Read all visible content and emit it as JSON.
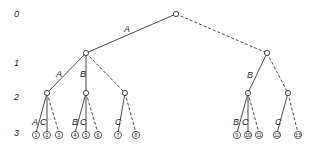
{
  "diagram": {
    "type": "decision-tree",
    "levels": [
      "0",
      "1",
      "2",
      "3"
    ],
    "nodes": {
      "root": {
        "x": 176,
        "y": 14
      },
      "l1": [
        {
          "x": 86,
          "y": 53
        },
        {
          "x": 267,
          "y": 53
        }
      ],
      "l2": [
        {
          "x": 47,
          "y": 93
        },
        {
          "x": 86,
          "y": 93
        },
        {
          "x": 125,
          "y": 93
        },
        {
          "x": 248,
          "y": 93
        },
        {
          "x": 288,
          "y": 93
        }
      ],
      "leaves": [
        {
          "label": "1",
          "x": 36,
          "y": 133
        },
        {
          "label": "2",
          "x": 47,
          "y": 133
        },
        {
          "label": "3",
          "x": 59,
          "y": 133
        },
        {
          "label": "4",
          "x": 75,
          "y": 133
        },
        {
          "label": "5",
          "x": 86,
          "y": 133
        },
        {
          "label": "6",
          "x": 98,
          "y": 133
        },
        {
          "label": "7",
          "x": 118,
          "y": 133
        },
        {
          "label": "8",
          "x": 136,
          "y": 133
        },
        {
          "label": "9",
          "x": 237,
          "y": 133
        },
        {
          "label": "10",
          "x": 248,
          "y": 133
        },
        {
          "label": "11",
          "x": 259,
          "y": 133
        },
        {
          "label": "12",
          "x": 277,
          "y": 133
        },
        {
          "label": "13",
          "x": 298,
          "y": 133
        }
      ]
    },
    "edge_labels": {
      "root_left": "A",
      "l1l_a": "A",
      "l1l_b": "B",
      "l1r_b": "B",
      "l2_0_a": "A",
      "l2_0_c": "C",
      "l2_1_b": "B",
      "l2_1_c": "C",
      "l2_2_c": "C",
      "l2_3_b": "B",
      "l2_3_c": "C",
      "l2_4_c": "C"
    },
    "legend": {
      "solid": "chosen branch",
      "dashed": "alternative branch"
    }
  }
}
